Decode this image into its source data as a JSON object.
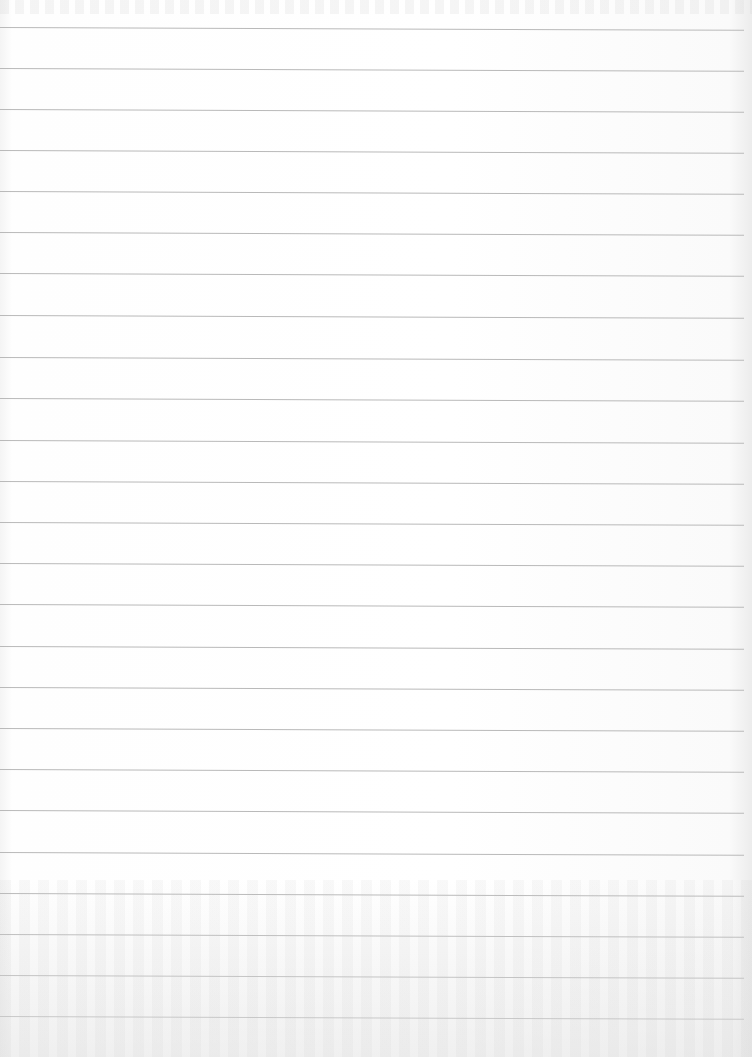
{
  "page": {
    "type": "lined-paper",
    "paper_color": "#fdfdfd",
    "rule_color": "#b9b9b9",
    "rule_spacing_px": 41,
    "rule_positions_y": [
      27,
      68,
      109,
      150,
      191,
      232,
      273,
      315,
      357,
      398,
      440,
      481,
      522,
      563,
      604,
      646,
      687,
      728,
      769,
      810,
      852,
      893,
      934,
      975,
      1016
    ]
  }
}
